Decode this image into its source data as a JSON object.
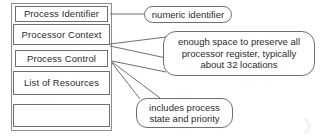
{
  "diagram": {
    "colors": {
      "background": "#ffffff",
      "line": "#6f6f6f",
      "frame": "#8d8d8d",
      "text": "#2b2b2b",
      "watermark": "#f2f2f2"
    },
    "pcb_rows": [
      {
        "id": "process-identifier",
        "label": "Process Identifier"
      },
      {
        "id": "processor-context",
        "label": "Processor Context"
      },
      {
        "id": "process-control",
        "label": "Process Control"
      },
      {
        "id": "list-of-resources",
        "label": "List of Resources"
      },
      {
        "id": "empty-row",
        "label": ""
      }
    ],
    "callouts": [
      {
        "id": "numeric-identifier",
        "text": "numeric identifier",
        "target": "Process Identifier"
      },
      {
        "id": "processor-register-space",
        "line1": "enough space to preserve all",
        "line2": "processor register, typically",
        "line3": "about 32 locations",
        "target": "Processor Context"
      },
      {
        "id": "process-state-priority",
        "line1": "includes process",
        "line2": "state and priority",
        "target": "Process Control"
      }
    ],
    "watermark": {
      "glyph": "❯"
    }
  }
}
